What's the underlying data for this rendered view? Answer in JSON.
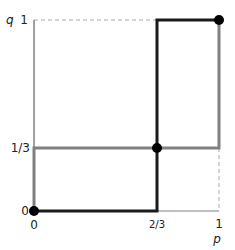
{
  "diagram": {
    "axes": {
      "x_label": "p",
      "y_label": "q",
      "x_ticks": [
        "0",
        "2/3",
        "1"
      ],
      "y_ticks": [
        "0",
        "1/3",
        "1"
      ]
    },
    "points": [
      {
        "name": "origin",
        "p": 0,
        "q": 0
      },
      {
        "name": "mixed",
        "p": "2/3",
        "q": "1/3"
      },
      {
        "name": "top-right",
        "p": 1,
        "q": 1
      }
    ],
    "colors": {
      "best_response_p": "#1a1a1a",
      "best_response_q": "#808080",
      "axis": "#808080",
      "dashed": "#aaaaaa"
    }
  }
}
